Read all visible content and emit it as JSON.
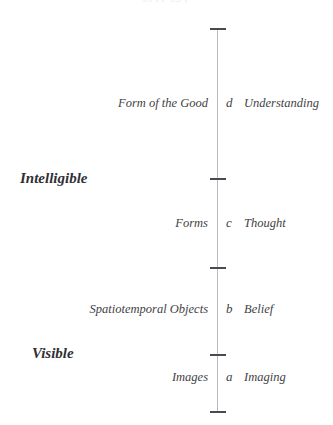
{
  "figure": {
    "axis_color": "#b9b9bf",
    "tick_color": "#4a4a50",
    "text_color": "#3f3f45",
    "background": "#ffffff",
    "cut_off_text": "gg pp gg p"
  },
  "realms": [
    {
      "label": "Intelligible"
    },
    {
      "label": "Visible"
    }
  ],
  "segments": [
    {
      "object": "Form of the Good",
      "letter": "d",
      "state": "Understanding"
    },
    {
      "object": "Forms",
      "letter": "c",
      "state": "Thought"
    },
    {
      "object": "Spatiotemporal Objects",
      "letter": "b",
      "state": "Belief"
    },
    {
      "object": "Images",
      "letter": "a",
      "state": "Imaging"
    }
  ],
  "ticks": [
    {
      "name": "top-terminus"
    },
    {
      "name": "division-c-d"
    },
    {
      "name": "division-b-c"
    },
    {
      "name": "division-a-b"
    },
    {
      "name": "bottom-terminus"
    }
  ]
}
